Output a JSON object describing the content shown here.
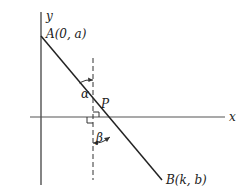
{
  "diagram": {
    "axes": {
      "x_label": "x",
      "y_label": "y"
    },
    "points": {
      "A": {
        "name": "A",
        "coords": "(0, a)"
      },
      "B": {
        "name": "B",
        "coords": "(k, b)"
      },
      "P": {
        "name": "P"
      }
    },
    "angles": {
      "alpha": "α",
      "beta": "β"
    },
    "colors": {
      "line": "#222222",
      "background": "#ffffff"
    }
  }
}
